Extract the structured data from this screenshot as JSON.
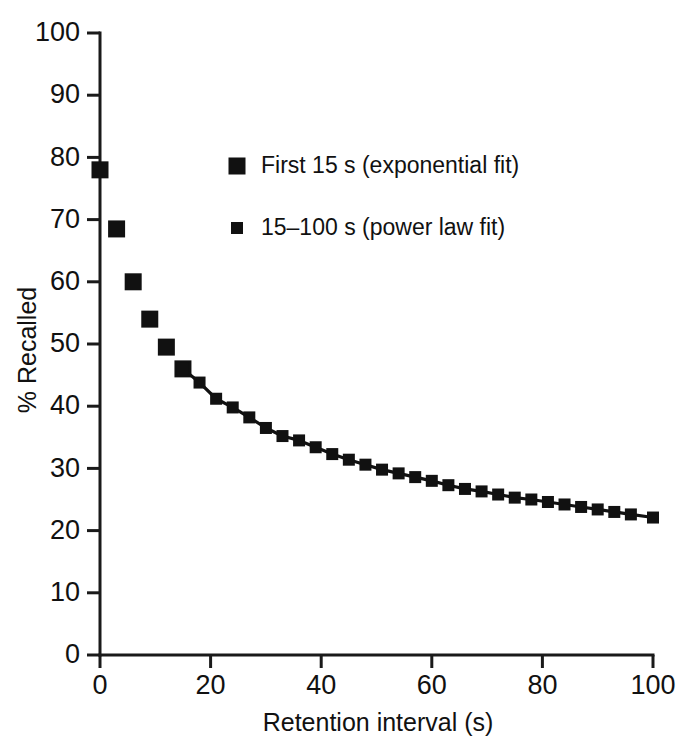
{
  "chart_data": {
    "type": "scatter",
    "title": "",
    "xlabel": "Retention interval (s)",
    "ylabel": "% Recalled",
    "xlim": [
      0,
      100
    ],
    "ylim": [
      0,
      100
    ],
    "xticks": [
      0,
      20,
      40,
      60,
      80,
      100
    ],
    "yticks": [
      0,
      10,
      20,
      30,
      40,
      50,
      60,
      70,
      80,
      90,
      100
    ],
    "grid": false,
    "legend_position": "upper-center",
    "marker_color": "#111111",
    "axis_color": "#1a1a1a",
    "background": "#ffffff",
    "series": [
      {
        "name": "First 15 s (exponential fit)",
        "marker": "square-large",
        "connected": false,
        "x": [
          0,
          3,
          6,
          9,
          12,
          15
        ],
        "y": [
          78,
          68.5,
          60,
          54,
          49.5,
          46
        ]
      },
      {
        "name": "15–100 s (power law fit)",
        "marker": "square-small",
        "connected": true,
        "x": [
          15,
          18,
          21,
          24,
          27,
          30,
          33,
          36,
          39,
          42,
          45,
          48,
          51,
          54,
          57,
          60,
          63,
          66,
          69,
          72,
          75,
          78,
          81,
          84,
          87,
          90,
          93,
          96,
          100
        ],
        "y": [
          46,
          43.8,
          41.2,
          39.8,
          38.2,
          36.5,
          35.2,
          34.5,
          33.4,
          32.3,
          31.4,
          30.6,
          29.8,
          29.2,
          28.6,
          28.0,
          27.3,
          26.7,
          26.3,
          25.8,
          25.3,
          25.0,
          24.6,
          24.2,
          23.8,
          23.4,
          23.0,
          22.6,
          22.1
        ]
      }
    ],
    "legend": [
      {
        "label": "First 15 s (exponential fit)",
        "marker": "square-large",
        "marker_size": 17
      },
      {
        "label": "15–100 s (power law fit)",
        "marker": "square-small",
        "marker_size": 12
      }
    ],
    "tick_labels": {
      "x": [
        "0",
        "20",
        "40",
        "60",
        "80",
        "100"
      ],
      "y": [
        "0",
        "10",
        "20",
        "30",
        "40",
        "50",
        "60",
        "70",
        "80",
        "90",
        "100"
      ]
    }
  }
}
